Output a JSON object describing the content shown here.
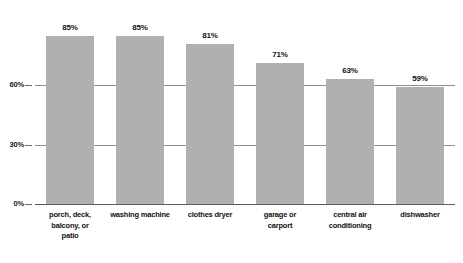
{
  "chart_data": {
    "type": "bar",
    "title": "",
    "subtitle": "",
    "xlabel": "",
    "ylabel": "",
    "ylim": [
      0,
      100
    ],
    "grid": true,
    "legend": false,
    "legend_position": "none",
    "orientation": "vertical",
    "bar_color": "#b0b0b0",
    "gridline_color": "#8c8c8c",
    "baseline_color": "#5a5a5a",
    "y_ticks": [
      "0%",
      "30%",
      "60%"
    ],
    "y_tick_values": [
      0,
      30,
      60
    ],
    "categories": [
      "porch, deck, balcony, or patio",
      "washing machine",
      "clothes dryer",
      "garage or carport",
      "central air conditioning",
      "dishwasher"
    ],
    "category_lines": [
      [
        "porch, deck,",
        "balcony, or",
        "patio"
      ],
      [
        "washing machine"
      ],
      [
        "clothes dryer"
      ],
      [
        "garage or",
        "carport"
      ],
      [
        "central air",
        "conditioning"
      ],
      [
        "dishwasher"
      ]
    ],
    "values": [
      85,
      85,
      81,
      71,
      63,
      59
    ],
    "value_labels": [
      "85%",
      "85%",
      "81%",
      "71%",
      "63%",
      "59%"
    ]
  }
}
